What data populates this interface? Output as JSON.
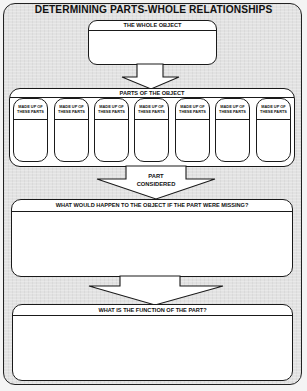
{
  "worksheet": {
    "title": "DETERMINING PARTS-WHOLE RELATIONSHIPS",
    "whole_object": {
      "header": "THE WHOLE OBJECT",
      "value": ""
    },
    "parts_of_object": {
      "header": "PARTS OF THE OBJECT",
      "parts": [
        {
          "header_line1": "MADE UP OF",
          "header_line2": "THESE PARTS",
          "value": ""
        },
        {
          "header_line1": "MADE UP OF",
          "header_line2": "THESE PARTS",
          "value": ""
        },
        {
          "header_line1": "MADE UP OF",
          "header_line2": "THESE PARTS",
          "value": ""
        },
        {
          "header_line1": "MADE UP OF",
          "header_line2": "THESE PARTS",
          "value": ""
        },
        {
          "header_line1": "MADE UP OF",
          "header_line2": "THESE PARTS",
          "value": ""
        },
        {
          "header_line1": "MADE UP OF",
          "header_line2": "THESE PARTS",
          "value": ""
        },
        {
          "header_line1": "MADE UP OF",
          "header_line2": "THESE PARTS",
          "value": ""
        }
      ]
    },
    "part_considered_arrow": {
      "label_line1": "PART",
      "label_line2": "CONSIDERED"
    },
    "if_missing": {
      "header": "WHAT WOULD HAPPEN TO THE OBJECT IF THE PART WERE MISSING?",
      "value": ""
    },
    "function": {
      "header": "WHAT IS THE FUNCTION OF THE PART?",
      "value": ""
    }
  },
  "colors": {
    "background": "#e2e2e2",
    "box_fill": "#ffffff",
    "stroke": "#1a1a1a"
  }
}
